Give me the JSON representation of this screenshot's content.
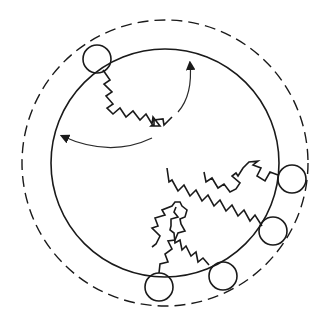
{
  "diagram": {
    "type": "polymer-brush-on-cylinder",
    "outer_boundary": {
      "style": "dashed",
      "cx": 165,
      "cy": 163,
      "r": 143
    },
    "inner_surface": {
      "style": "solid",
      "cx": 165,
      "cy": 163,
      "r": 114
    },
    "beads": [
      {
        "cx": 97,
        "cy": 59,
        "r": 14
      },
      {
        "cx": 292,
        "cy": 179,
        "r": 14
      },
      {
        "cx": 273,
        "cy": 231,
        "r": 14
      },
      {
        "cx": 223,
        "cy": 276,
        "r": 14
      },
      {
        "cx": 159,
        "cy": 287,
        "r": 14
      }
    ],
    "arrows": [
      {
        "direction": "counterclockwise-up",
        "label": ""
      },
      {
        "direction": "counterclockwise-left",
        "label": ""
      }
    ],
    "colors": {
      "line": "#1a1a1a",
      "background": "#ffffff"
    }
  }
}
